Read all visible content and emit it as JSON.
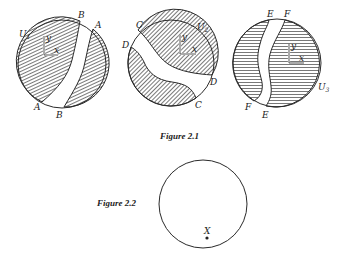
{
  "figures": [
    {
      "caption": "Figure 2.1",
      "panels": [
        {
          "set_label": "U",
          "set_subscript": "1",
          "axis_labels": {
            "x": "x",
            "y": "y"
          },
          "boundary_labels": {
            "top_left": "B",
            "top_right": "A",
            "bottom_left": "A",
            "bottom_right": "B"
          }
        },
        {
          "set_label": "U",
          "set_subscript": "2",
          "axis_labels": {
            "x": "x",
            "y": "y"
          },
          "boundary_labels": {
            "upper_left_top": "C",
            "upper_left_side": "D",
            "right": "D",
            "bottom_right": "C"
          }
        },
        {
          "set_label": "U",
          "set_subscript": "3",
          "axis_labels": {
            "x": "x",
            "y": "y"
          },
          "boundary_labels": {
            "top_left": "E",
            "top_right": "F",
            "bottom_left": "F",
            "bottom_right": "E"
          }
        }
      ]
    },
    {
      "caption": "Figure 2.2",
      "point_label": "X"
    }
  ],
  "colors": {
    "ink": "#2a2a2a",
    "hatch": "#555555",
    "background": "#ffffff"
  }
}
